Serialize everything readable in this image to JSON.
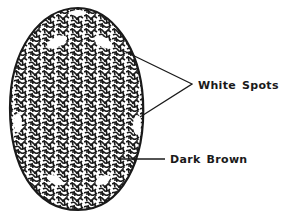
{
  "diagram": {
    "labels": [
      {
        "id": "white-spots",
        "text": "White Spots"
      },
      {
        "id": "dark-brown",
        "text": "Dark Brown"
      }
    ],
    "colors": {
      "background": "#ffffff",
      "ink": "#1a1a1a"
    }
  }
}
